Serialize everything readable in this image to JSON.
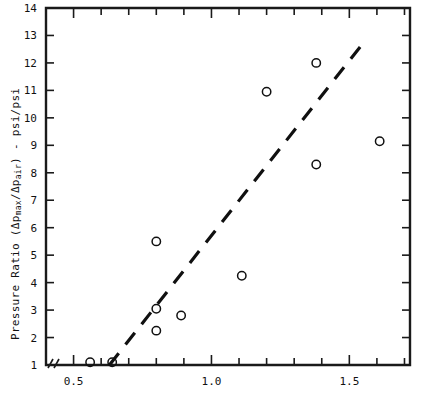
{
  "chart_data": {
    "type": "scatter",
    "title": "",
    "xlabel": "",
    "ylabel": "Pressure Ratio (Δp_max/Δp_air) - psi/psi",
    "ylabel_parts": {
      "prefix": "Pressure Ratio (Δp",
      "sub1": "max",
      "mid": "/Δp",
      "sub2": "air",
      "suffix": ") - psi/psi"
    },
    "xlim": [
      0.4,
      1.72
    ],
    "ylim": [
      1,
      14
    ],
    "grid": false,
    "legend": "none",
    "axis_break": true,
    "x_ticklabels": [
      "0.5",
      "1.0",
      "1.5"
    ],
    "x_tickvalues": [
      0.5,
      1.0,
      1.5
    ],
    "x_minor_step": 0.1,
    "y_ticklabels": [
      "1",
      "2",
      "3",
      "4",
      "5",
      "6",
      "7",
      "8",
      "9",
      "10",
      "11",
      "12",
      "13",
      "14"
    ],
    "y_tickvalues": [
      1,
      2,
      3,
      4,
      5,
      6,
      7,
      8,
      9,
      10,
      11,
      12,
      13,
      14
    ],
    "series": [
      {
        "name": "data",
        "marker": "open-circle",
        "points": [
          {
            "x": 0.56,
            "y": 1.1
          },
          {
            "x": 0.64,
            "y": 1.1
          },
          {
            "x": 0.8,
            "y": 5.5
          },
          {
            "x": 0.8,
            "y": 3.05
          },
          {
            "x": 0.8,
            "y": 2.25
          },
          {
            "x": 0.89,
            "y": 2.8
          },
          {
            "x": 1.11,
            "y": 4.25
          },
          {
            "x": 1.2,
            "y": 10.95
          },
          {
            "x": 1.38,
            "y": 12.0
          },
          {
            "x": 1.38,
            "y": 8.3
          },
          {
            "x": 1.61,
            "y": 9.15
          }
        ]
      },
      {
        "name": "trend-line",
        "style": "dashed",
        "x": [
          0.63,
          1.56
        ],
        "y": [
          1.0,
          12.85
        ]
      }
    ],
    "colors": {
      "axis": "#1a1a1a",
      "marker": "#101010",
      "trend": "#101010",
      "background": "#ffffff"
    }
  }
}
